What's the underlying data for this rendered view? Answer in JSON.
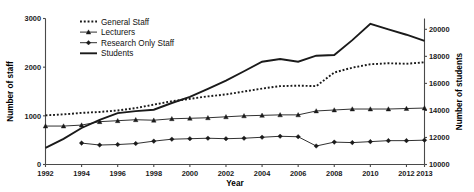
{
  "chart_data": {
    "type": "line",
    "title": "",
    "xlabel": "Year",
    "ylabel": "Number of staff",
    "ylabel_right": "Number of students",
    "grid": false,
    "legend_position": "top-center-left",
    "x": [
      1992,
      1993,
      1994,
      1995,
      1996,
      1997,
      1998,
      1999,
      2000,
      2001,
      2002,
      2003,
      2004,
      2005,
      2006,
      2007,
      2008,
      2009,
      2010,
      2011,
      2012,
      2013
    ],
    "xlim": [
      1992,
      2013
    ],
    "xticks": [
      1992,
      1994,
      1996,
      1998,
      2000,
      2002,
      2004,
      2006,
      2008,
      2010,
      2012,
      2013
    ],
    "xticklabels": [
      "1992",
      "1994",
      "1996",
      "1998",
      "2000",
      "2002",
      "2004",
      "2006",
      "2008",
      "2010",
      "2012",
      "2013"
    ],
    "ylim": [
      0,
      3000
    ],
    "yticks": [
      0,
      1000,
      2000,
      3000
    ],
    "yticklabels": [
      "0",
      "1000",
      "2000",
      "3000"
    ],
    "ylim_right": [
      10000,
      20800
    ],
    "yticks_right": [
      10000,
      12000,
      14000,
      16000,
      18000,
      20000
    ],
    "yticklabels_right": [
      "10000",
      "12000",
      "14000",
      "16000",
      "18000",
      "20000"
    ],
    "series": [
      {
        "name": "General Staff",
        "axis": "left",
        "style": "dotted",
        "marker": "none",
        "values": [
          1010,
          1030,
          1060,
          1080,
          1110,
          1160,
          1230,
          1300,
          1350,
          1400,
          1440,
          1500,
          1560,
          1610,
          1620,
          1610,
          1890,
          1990,
          2060,
          2080,
          2070,
          2100
        ]
      },
      {
        "name": "Lecturers",
        "axis": "left",
        "style": "solid",
        "marker": "triangle",
        "values": [
          790,
          790,
          810,
          880,
          900,
          920,
          910,
          940,
          950,
          960,
          980,
          1000,
          1010,
          1020,
          1020,
          1100,
          1120,
          1140,
          1140,
          1140,
          1150,
          1160
        ]
      },
      {
        "name": "Research Only Staff",
        "axis": "left",
        "style": "solid",
        "marker": "diamond",
        "values": [
          null,
          null,
          440,
          400,
          410,
          430,
          480,
          520,
          530,
          540,
          530,
          540,
          560,
          580,
          570,
          380,
          460,
          450,
          470,
          490,
          490,
          500
        ]
      },
      {
        "name": "Students",
        "axis": "right",
        "style": "solid",
        "marker": "none",
        "values": [
          11230,
          11900,
          12700,
          13300,
          13800,
          13950,
          14050,
          14550,
          15000,
          15600,
          16200,
          16900,
          17600,
          17800,
          17600,
          18050,
          18100,
          19200,
          20400,
          20000,
          19600,
          19150
        ]
      }
    ]
  },
  "legend": {
    "items": [
      {
        "label": "General Staff"
      },
      {
        "label": "Lecturers"
      },
      {
        "label": "Research Only Staff"
      },
      {
        "label": "Students"
      }
    ]
  }
}
